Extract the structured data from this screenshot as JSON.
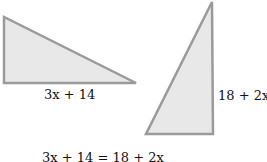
{
  "diagram": {
    "left_triangle": {
      "points": "4,17 4,83 136,83",
      "fill": "#e8e8e8",
      "stroke": "#9a9a9a",
      "label": "3x + 14"
    },
    "right_triangle": {
      "points": "212,2 146,134 213,134",
      "fill": "#e8e8e8",
      "stroke": "#9a9a9a",
      "label": "18 + 2x"
    },
    "equation": "3x + 14 = 18 + 2x"
  }
}
